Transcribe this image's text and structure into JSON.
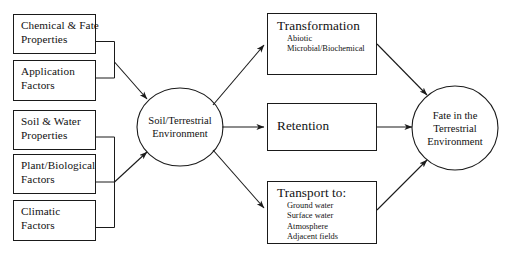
{
  "diagram": {
    "colors": {
      "stroke": "#1a1a1a",
      "text": "#111111",
      "background": "#ffffff"
    },
    "inputs": [
      {
        "label": "Chemical & Fate\nProperties",
        "line1": "Chemical & Fate",
        "line2": "Properties"
      },
      {
        "label": "Application\nFactors",
        "line1": "Application",
        "line2": "Factors"
      },
      {
        "label": "Soil & Water\nProperties",
        "line1": "Soil & Water",
        "line2": "Properties"
      },
      {
        "label": "Plant/Biological\nFactors",
        "line1": "Plant/Biological",
        "line2": "Factors"
      },
      {
        "label": "Climatic\nFactors",
        "line1": "Climatic",
        "line2": "Factors"
      }
    ],
    "center_node": {
      "label": "Soil/Terrestrial\nEnvironment"
    },
    "processes": [
      {
        "title": "Transformation",
        "items": [
          "Abiotic",
          "Microbial/Biochemical"
        ]
      },
      {
        "title": "Retention",
        "items": []
      },
      {
        "title": "Transport to:",
        "items": [
          "Ground water",
          "Surface water",
          "Atmosphere",
          "Adjacent fields"
        ]
      }
    ],
    "outcome_node": {
      "label": "Fate in the\nTerrestrial\nEnvironment"
    }
  }
}
